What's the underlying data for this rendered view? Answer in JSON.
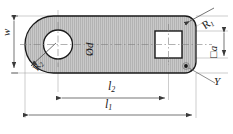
{
  "drawing": {
    "type": "engineering-dimension-drawing",
    "title": "Slotted lever plate with bore and square hole",
    "view": "plan view with section hatching",
    "colors": {
      "body_fill": "#c9c9c9",
      "hatch": "#a8a8a8",
      "outline": "#1a1a1a",
      "centerline": "#8a8a8a",
      "dimension_line": "#4a4a4a",
      "background": "#ffffff"
    },
    "geometry": {
      "body_left": 25,
      "body_right": 196,
      "body_top": 16,
      "body_bottom": 73,
      "left_radius": 28.5,
      "right_corner_radius": 11,
      "bore_center_x": 58,
      "bore_center_y": 44.5,
      "bore_radius": 14.5,
      "square_x": 155,
      "square_y": 31,
      "square_size": 27,
      "point_marker_x": 186,
      "point_marker_y": 66
    },
    "labels": {
      "width": "w",
      "bore_diameter_prefix": "Ø",
      "bore_diameter": "d",
      "corner_radius_major": "R",
      "corner_radius_major_sub": "1",
      "corner_radius_minor": "R",
      "corner_radius_minor_sub": "2",
      "square_prefix": "□",
      "square_size": "a",
      "surface_mark": "✓",
      "length_inner": "l",
      "length_inner_sub": "2",
      "length_outer": "l",
      "length_outer_sub": "1"
    },
    "dimensions": [
      {
        "name": "w",
        "orientation": "vertical",
        "position": "left",
        "label": "w"
      },
      {
        "name": "l2",
        "orientation": "horizontal",
        "position": "bottom",
        "label": "l2"
      },
      {
        "name": "l1",
        "orientation": "horizontal",
        "position": "bottom",
        "label": "l1"
      },
      {
        "name": "a",
        "orientation": "vertical",
        "position": "right",
        "label": "a"
      }
    ],
    "leaders": [
      {
        "name": "R1",
        "from": "top-right-corner",
        "label": "R1"
      },
      {
        "name": "R2",
        "from": "left-arc",
        "label": "R2"
      },
      {
        "name": "Y",
        "from": "bottom-right-edge",
        "label": "Y"
      }
    ]
  }
}
